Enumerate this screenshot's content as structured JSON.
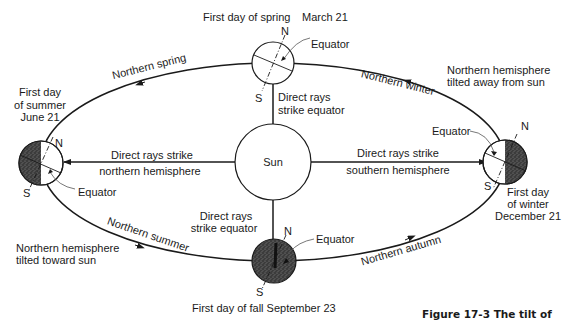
{
  "sun": {
    "label": "Sun"
  },
  "positions": {
    "spring": {
      "title": "First day  of spring",
      "date": "March 21",
      "north": "N",
      "south": "S",
      "equator": "Equator",
      "rays": [
        "Direct rays",
        "strike equator"
      ]
    },
    "summer": {
      "title_lines": [
        "First day",
        "of summer",
        "June 21"
      ],
      "north": "N",
      "south": "S",
      "equator": "Equator",
      "rays": [
        "Direct rays strike",
        "northern hemisphere"
      ],
      "tilt": [
        "Northern hemisphere",
        "tilted toward sun"
      ]
    },
    "fall": {
      "title": "First day  of fall  September 23",
      "north": "N",
      "south": "S",
      "equator": "Equator",
      "rays": [
        "Direct rays",
        "strike equator"
      ]
    },
    "winter": {
      "title_lines": [
        "First day",
        "of winter",
        "December 21"
      ],
      "north": "N",
      "south": "S",
      "equator": "Equator",
      "rays": [
        "Direct rays strike",
        "southern hemisphere"
      ],
      "tilt": [
        "Northern hemisphere",
        "tilted away from sun"
      ]
    }
  },
  "seasons": {
    "spring": "Northern spring",
    "summer": "Northern summer",
    "autumn": "Northern autumn",
    "winter": "Northern winter"
  },
  "caption": "Figure 17-3  The tilt of",
  "colors": {
    "ink": "#1a1a1a",
    "shadow": "#4a4a4a",
    "background": "#ffffff"
  }
}
